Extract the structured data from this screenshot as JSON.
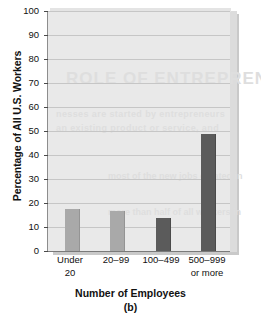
{
  "chart_data": {
    "type": "bar",
    "title": "",
    "caption": "(b)",
    "xlabel": "Number of Employees",
    "ylabel": "Percentage of All U.S. Workers",
    "categories": [
      "Under 20",
      "20–99",
      "100–499",
      "500–999 or more"
    ],
    "category_lines": [
      [
        "Under",
        "20"
      ],
      [
        "20–99"
      ],
      [
        "100–499"
      ],
      [
        "500–999",
        "or more"
      ]
    ],
    "values": [
      17.5,
      16.5,
      13.8,
      48.7
    ],
    "ylim": [
      0,
      100
    ],
    "ytick_step": 10,
    "yticks": [
      0,
      10,
      20,
      30,
      40,
      50,
      60,
      70,
      80,
      90,
      100
    ],
    "ytick_labels": [
      "0",
      "10",
      "20",
      "30",
      "40",
      "50",
      "60",
      "70",
      "80",
      "90",
      "100"
    ],
    "grid": true,
    "legend": "none",
    "bar_colors": [
      "#a9a9a9",
      "#a9a9a9",
      "#5b5b5b",
      "#5b5b5b"
    ],
    "plot_background": "#e9e9e9",
    "gridline_color": "#c6c6c6",
    "axis_color": "#7a7a7a"
  },
  "ghost_text": {
    "line1": "ROLE OF ENTREPRENEURS",
    "line2": "nesses are started by entrepreneurs",
    "line3": "an existing product or service, and",
    "line4": "most of the new jobs created in",
    "line5": "more than half of all workers in"
  }
}
